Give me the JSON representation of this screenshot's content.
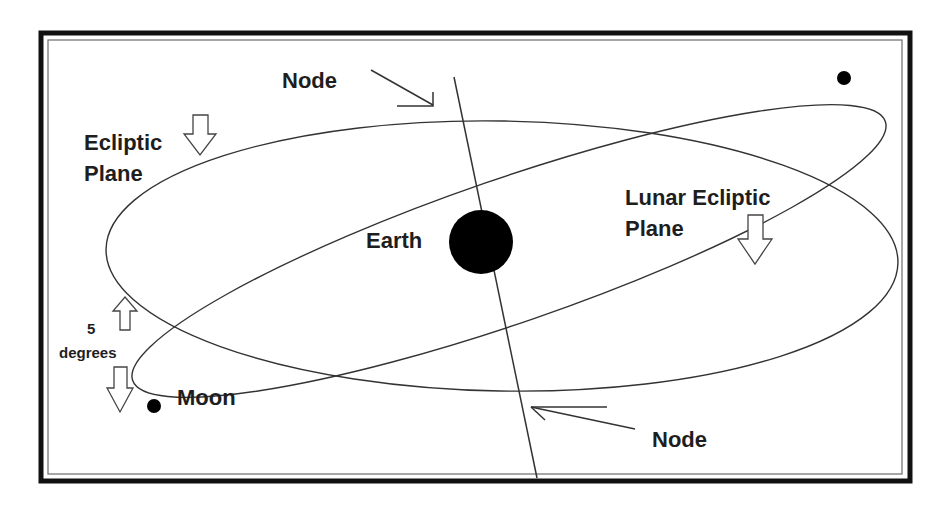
{
  "diagram": {
    "labels": {
      "node_top": "Node",
      "node_bottom": "Node",
      "ecliptic_line1": "Ecliptic",
      "ecliptic_line2": "Plane",
      "lunar_line1": "Lunar Ecliptic",
      "lunar_line2": "Plane",
      "earth": "Earth",
      "moon": "Moon",
      "inclination_value": "5",
      "inclination_unit": "degrees"
    },
    "bodies": [
      {
        "name": "Earth",
        "cx": 481,
        "cy": 242,
        "r": 32,
        "color": "#000000"
      },
      {
        "name": "Moon",
        "cx": 154,
        "cy": 406,
        "r": 7,
        "color": "#000000"
      },
      {
        "name": "Moon (opposite position)",
        "cx": 844,
        "cy": 78,
        "r": 7,
        "color": "#000000"
      }
    ],
    "orbits": [
      {
        "name": "Ecliptic Plane",
        "cx": 502,
        "cy": 256,
        "rx": 396,
        "ry": 135,
        "rotation_deg": 1
      },
      {
        "name": "Lunar Ecliptic Plane",
        "cx": 509,
        "cy": 250,
        "rx": 397,
        "ry": 72,
        "rotation_deg": -19
      }
    ],
    "inclination_deg": 5,
    "colors": {
      "background": "#ffffff",
      "frame": "#111111",
      "line": "#333333",
      "text": "#1e1e1e"
    }
  }
}
